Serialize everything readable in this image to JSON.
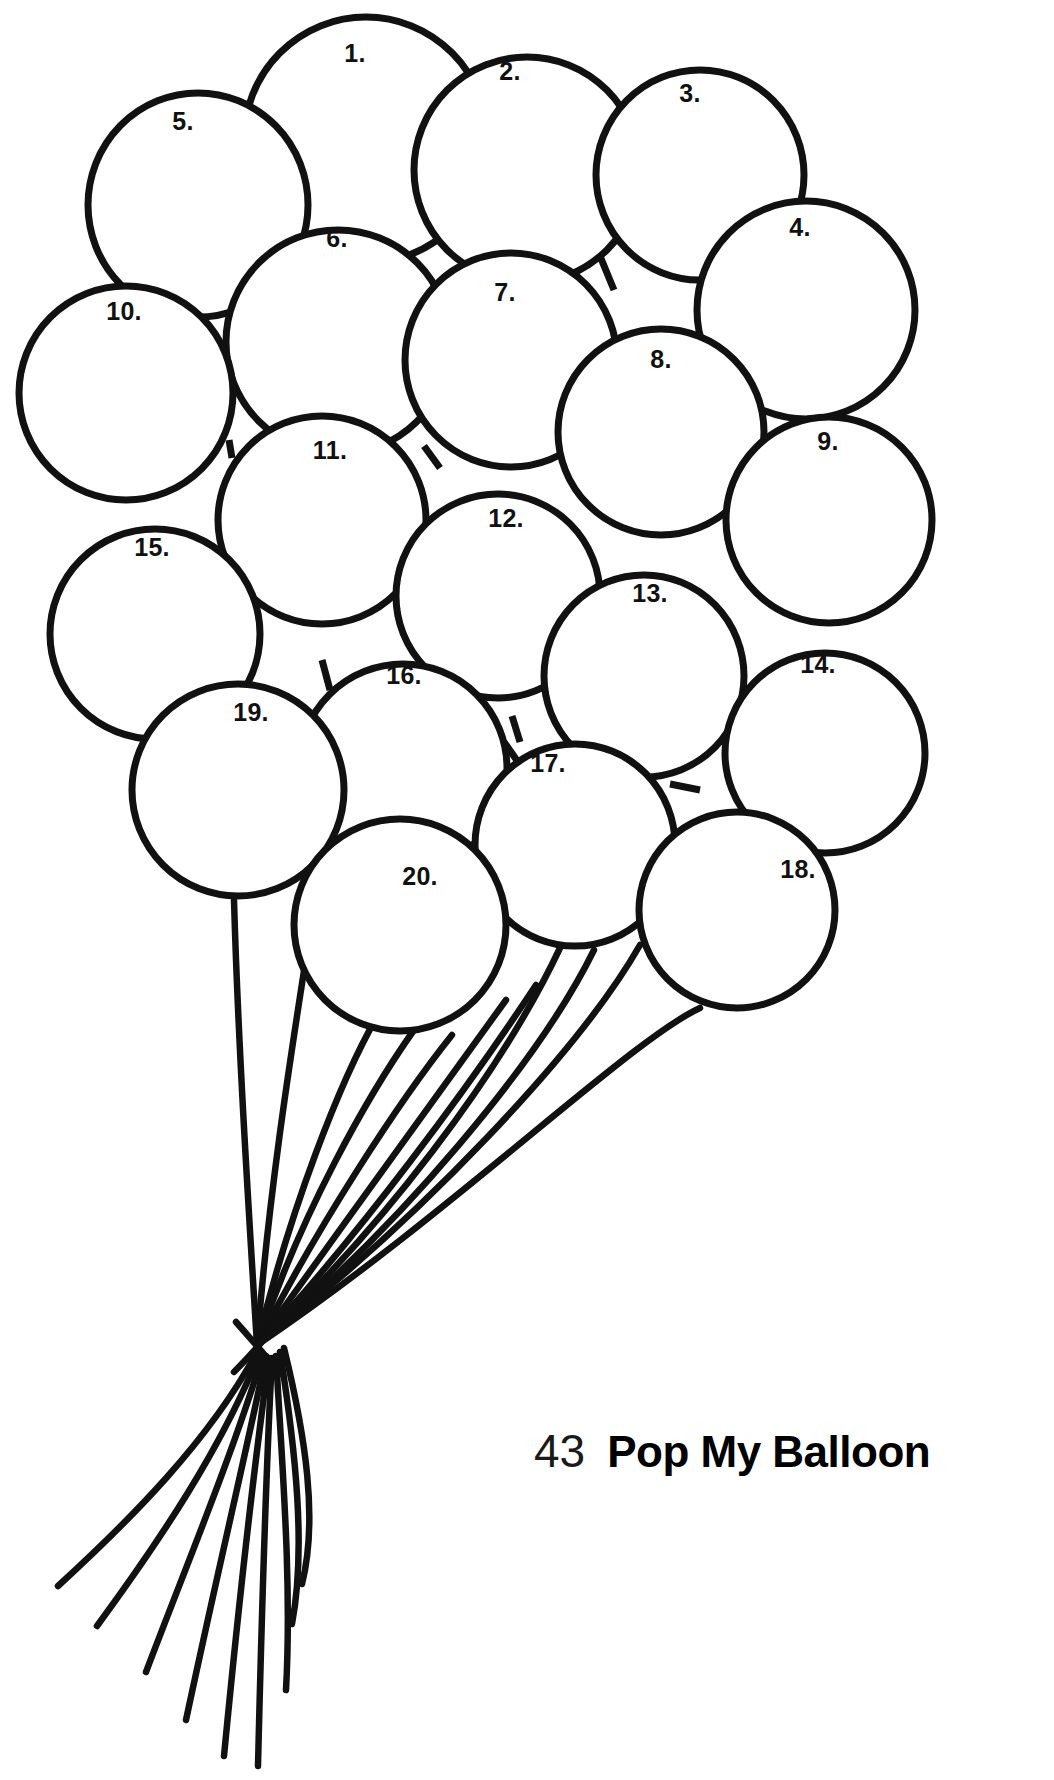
{
  "page": {
    "background_color": "#ffffff",
    "ink_color": "#111111",
    "width": 1054,
    "height": 1780
  },
  "footer": {
    "page_number": "43",
    "title": "Pop My Balloon"
  },
  "artwork": {
    "kind": "coloring-page-balloon-bunch",
    "balloon_count": 20,
    "balloons": [
      {
        "label": "1.",
        "cx": 366,
        "cy": 140,
        "r": 122,
        "label_x": 355,
        "label_y": 62
      },
      {
        "label": "2.",
        "cx": 527,
        "cy": 170,
        "r": 113,
        "label_x": 510,
        "label_y": 80
      },
      {
        "label": "3.",
        "cx": 700,
        "cy": 175,
        "r": 104,
        "label_x": 690,
        "label_y": 102
      },
      {
        "label": "4.",
        "cx": 806,
        "cy": 310,
        "r": 109,
        "label_x": 800,
        "label_y": 236
      },
      {
        "label": "5.",
        "cx": 198,
        "cy": 205,
        "r": 110,
        "label_x": 183,
        "label_y": 130
      },
      {
        "label": "6.",
        "cx": 338,
        "cy": 342,
        "r": 112,
        "label_x": 337,
        "label_y": 247
      },
      {
        "label": "7.",
        "cx": 511,
        "cy": 360,
        "r": 106,
        "label_x": 505,
        "label_y": 301
      },
      {
        "label": "8.",
        "cx": 661,
        "cy": 432,
        "r": 103,
        "label_x": 661,
        "label_y": 368
      },
      {
        "label": "9.",
        "cx": 829,
        "cy": 520,
        "r": 103,
        "label_x": 828,
        "label_y": 450
      },
      {
        "label": "10.",
        "cx": 126,
        "cy": 393,
        "r": 107,
        "label_x": 124,
        "label_y": 320
      },
      {
        "label": "11.",
        "cx": 322,
        "cy": 520,
        "r": 104,
        "label_x": 330,
        "label_y": 459
      },
      {
        "label": "12.",
        "cx": 498,
        "cy": 596,
        "r": 102,
        "label_x": 506,
        "label_y": 527
      },
      {
        "label": "13.",
        "cx": 644,
        "cy": 676,
        "r": 100,
        "label_x": 650,
        "label_y": 602
      },
      {
        "label": "14.",
        "cx": 825,
        "cy": 753,
        "r": 100,
        "label_x": 818,
        "label_y": 673
      },
      {
        "label": "15.",
        "cx": 155,
        "cy": 634,
        "r": 105,
        "label_x": 152,
        "label_y": 556
      },
      {
        "label": "16.",
        "cx": 403,
        "cy": 768,
        "r": 104,
        "label_x": 404,
        "label_y": 684
      },
      {
        "label": "17.",
        "cx": 575,
        "cy": 845,
        "r": 100,
        "label_x": 548,
        "label_y": 772
      },
      {
        "label": "18.",
        "cx": 737,
        "cy": 910,
        "r": 98,
        "label_x": 798,
        "label_y": 878
      },
      {
        "label": "19.",
        "cx": 238,
        "cy": 790,
        "r": 106,
        "label_x": 251,
        "label_y": 721
      },
      {
        "label": "20.",
        "cx": 400,
        "cy": 925,
        "r": 106,
        "label_x": 420,
        "label_y": 885
      }
    ],
    "string_knot": {
      "x": 257,
      "y": 1345
    },
    "string_count": 11
  }
}
